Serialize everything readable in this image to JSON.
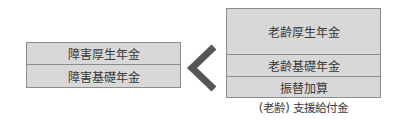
{
  "left_group": {
    "items": [
      "障害厚生年金",
      "障害基礎年金"
    ]
  },
  "comparison": {
    "symbol": "less-than-chevron",
    "color": "#555555"
  },
  "right_group": {
    "items": [
      "老齢厚生年金",
      "老齢基礎年金",
      "振替加算"
    ],
    "caption": "(老齢) 支援給付金"
  },
  "colors": {
    "box_fill": "#d8d8d8",
    "border": "#8c8c8c",
    "text": "#3a3a3a"
  }
}
